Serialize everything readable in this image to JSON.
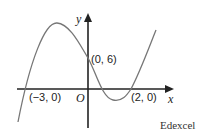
{
  "diagram": {
    "axes": {
      "x_label": "x",
      "y_label": "y",
      "origin_label": "O"
    },
    "points": [
      {
        "label": "(0, 6)",
        "meaning": "y-intercept"
      },
      {
        "label": "(−3, 0)",
        "meaning": "x-intercept"
      },
      {
        "label": "(2, 0)",
        "meaning": "x-intercept"
      }
    ],
    "source": "Edexcel",
    "curve_color": "#777777",
    "axis_color": "#222222"
  }
}
